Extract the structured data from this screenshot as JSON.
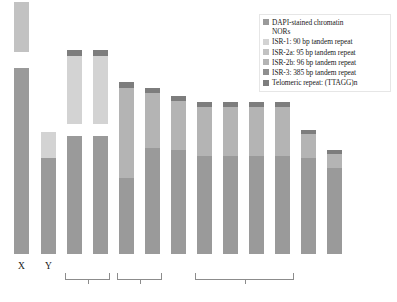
{
  "figure": {
    "type": "karyotype-ideogram",
    "background": "#ffffff"
  },
  "legend": {
    "position": "top-right",
    "items": [
      {
        "label": "DAPI-stained chromatin\nNORs",
        "color": "#9a9a9a",
        "key": "dapi-nors"
      },
      {
        "label": "ISR-1: 90 bp tandem repeat",
        "color": "#d3d3d3",
        "key": "isr-1"
      },
      {
        "label": "ISR-2a: 95 bp tandem repeat",
        "color": "#c2c2c2",
        "key": "isr-2a"
      },
      {
        "label": "ISR-2b: 96 bp tandem repeat",
        "color": "#b4b4b4",
        "key": "isr-2b"
      },
      {
        "label": "ISR-3: 385 bp tandem repeat",
        "color": "#8f8f8f",
        "key": "isr-3"
      },
      {
        "label": "Telomeric repeat: (TTAGG)n",
        "color": "#7d7d7d",
        "key": "telomeric"
      }
    ]
  },
  "colors": {
    "dapi": "#9a9a9a",
    "nor": "#ffffff",
    "isr1": "#d3d3d3",
    "isr2a": "#c2c2c2",
    "isr2b": "#b4b4b4",
    "isr3": "#8f8f8f",
    "telomere": "#7d7d7d",
    "bracket": "#8c8c8c",
    "text": "#1a1a1a"
  },
  "chart_data": {
    "type": "bar",
    "title": "",
    "xlabel": "",
    "ylabel": "",
    "categories": [
      "X",
      "Y",
      "3",
      "4",
      "5",
      "6",
      "7",
      "8",
      "9",
      "10",
      "11",
      "12",
      "13"
    ],
    "stack_order": "bottom-to-top",
    "chromosomes": [
      {
        "name": "X",
        "x": 14,
        "width": 15,
        "height": 252,
        "segments": [
          {
            "type": "dapi",
            "length": 186
          },
          {
            "type": "nor",
            "length": 16
          },
          {
            "type": "isr2a",
            "length": 50
          }
        ]
      },
      {
        "name": "Y",
        "x": 41,
        "width": 15,
        "height": 122,
        "segments": [
          {
            "type": "dapi",
            "length": 96
          },
          {
            "type": "isr1",
            "length": 26
          }
        ]
      },
      {
        "name": "3",
        "x": 67,
        "width": 15,
        "height": 204,
        "segments": [
          {
            "type": "dapi",
            "length": 118
          },
          {
            "type": "nor",
            "length": 12
          },
          {
            "type": "isr1",
            "length": 68
          },
          {
            "type": "telomere",
            "length": 6
          }
        ]
      },
      {
        "name": "4",
        "x": 93,
        "width": 15,
        "height": 204,
        "segments": [
          {
            "type": "dapi",
            "length": 118
          },
          {
            "type": "nor",
            "length": 12
          },
          {
            "type": "isr1",
            "length": 68
          },
          {
            "type": "telomere",
            "length": 6
          }
        ]
      },
      {
        "name": "5",
        "x": 119,
        "width": 15,
        "height": 172,
        "segments": [
          {
            "type": "dapi",
            "length": 76
          },
          {
            "type": "isr2b",
            "length": 90
          },
          {
            "type": "telomere",
            "length": 6
          }
        ]
      },
      {
        "name": "6",
        "x": 145,
        "width": 15,
        "height": 166,
        "segments": [
          {
            "type": "dapi",
            "length": 106
          },
          {
            "type": "isr2b",
            "length": 55
          },
          {
            "type": "telomere",
            "length": 5
          }
        ]
      },
      {
        "name": "7",
        "x": 171,
        "width": 15,
        "height": 158,
        "segments": [
          {
            "type": "dapi",
            "length": 104
          },
          {
            "type": "isr2b",
            "length": 49
          },
          {
            "type": "telomere",
            "length": 5
          }
        ]
      },
      {
        "name": "8",
        "x": 197,
        "width": 15,
        "height": 152,
        "segments": [
          {
            "type": "dapi",
            "length": 98
          },
          {
            "type": "isr2b",
            "length": 49
          },
          {
            "type": "telomere",
            "length": 5
          }
        ]
      },
      {
        "name": "9",
        "x": 223,
        "width": 15,
        "height": 152,
        "segments": [
          {
            "type": "dapi",
            "length": 98
          },
          {
            "type": "isr2b",
            "length": 49
          },
          {
            "type": "telomere",
            "length": 5
          }
        ]
      },
      {
        "name": "10",
        "x": 249,
        "width": 15,
        "height": 152,
        "segments": [
          {
            "type": "dapi",
            "length": 98
          },
          {
            "type": "isr2b",
            "length": 49
          },
          {
            "type": "telomere",
            "length": 5
          }
        ]
      },
      {
        "name": "11",
        "x": 275,
        "width": 15,
        "height": 152,
        "segments": [
          {
            "type": "dapi",
            "length": 98
          },
          {
            "type": "isr2b",
            "length": 49
          },
          {
            "type": "telomere",
            "length": 5
          }
        ]
      },
      {
        "name": "12",
        "x": 301,
        "width": 15,
        "height": 124,
        "segments": [
          {
            "type": "dapi",
            "length": 96
          },
          {
            "type": "isr2b",
            "length": 24
          },
          {
            "type": "telomere",
            "length": 4
          }
        ]
      },
      {
        "name": "13",
        "x": 327,
        "width": 15,
        "height": 104,
        "segments": [
          {
            "type": "dapi",
            "length": 86
          },
          {
            "type": "isr2b",
            "length": 14
          },
          {
            "type": "telomere",
            "length": 4
          }
        ]
      }
    ],
    "axis_labels": [
      {
        "text": "X",
        "x": 14,
        "width": 15
      },
      {
        "text": "Y",
        "x": 41,
        "width": 15
      }
    ],
    "brackets": [
      {
        "key": "bracket-pair-1",
        "x": 65,
        "width": 45
      },
      {
        "key": "bracket-pair-2",
        "x": 117,
        "width": 45
      },
      {
        "key": "bracket-group-3",
        "x": 195,
        "width": 99
      }
    ]
  }
}
